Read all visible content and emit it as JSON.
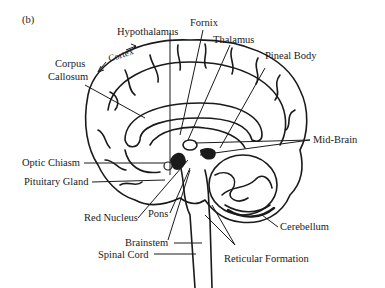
{
  "panel_label": "(b)",
  "labels": {
    "cortex": "Cortex",
    "hypothalamus": "Hypothalamus",
    "fornix": "Fornix",
    "thalamus": "Thalamus",
    "pineal_body": "Pineal Body",
    "corpus_callosum_1": "Corpus",
    "corpus_callosum_2": "Callosum",
    "mid_brain": "Mid-Brain",
    "optic_chiasm": "Optic Chiasm",
    "pituitary_gland": "Pituitary Gland",
    "red_nucleus": "Red Nucleus",
    "pons": "Pons",
    "cerebellum": "Cerebellum",
    "brainstem": "Brainstem",
    "spinal_cord": "Spinal Cord",
    "reticular_formation": "Reticular Formation"
  },
  "colors": {
    "ink": "#1a1a1a",
    "background": "#ffffff"
  }
}
